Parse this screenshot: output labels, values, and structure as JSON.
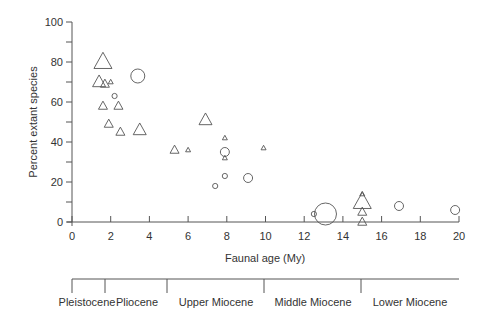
{
  "chart_data": {
    "type": "scatter",
    "title": "",
    "xlabel": "Faunal age (My)",
    "ylabel": "Percent extant species",
    "xlim": [
      0,
      20
    ],
    "ylim": [
      0,
      100
    ],
    "x_ticks": [
      0,
      2,
      4,
      6,
      8,
      10,
      12,
      14,
      16,
      18,
      20
    ],
    "y_ticks": [
      0,
      20,
      40,
      60,
      80,
      100
    ],
    "y_minor_ticks": [
      10,
      30,
      50,
      70,
      90
    ],
    "grid": false,
    "legend": null,
    "series": [
      {
        "name": "triangles",
        "marker": "triangle",
        "points": [
          {
            "x": 1.6,
            "y": 80,
            "size": "large"
          },
          {
            "x": 1.4,
            "y": 70,
            "size": "medium"
          },
          {
            "x": 1.7,
            "y": 69,
            "size": "small"
          },
          {
            "x": 2.0,
            "y": 70,
            "size": "tiny"
          },
          {
            "x": 1.6,
            "y": 58,
            "size": "small"
          },
          {
            "x": 2.4,
            "y": 58,
            "size": "small"
          },
          {
            "x": 1.9,
            "y": 49,
            "size": "small"
          },
          {
            "x": 2.5,
            "y": 45,
            "size": "small"
          },
          {
            "x": 3.5,
            "y": 46,
            "size": "medium"
          },
          {
            "x": 5.3,
            "y": 36,
            "size": "small"
          },
          {
            "x": 6.0,
            "y": 36,
            "size": "tiny"
          },
          {
            "x": 6.9,
            "y": 51,
            "size": "medium"
          },
          {
            "x": 7.9,
            "y": 42,
            "size": "tiny"
          },
          {
            "x": 7.9,
            "y": 32,
            "size": "tiny"
          },
          {
            "x": 9.9,
            "y": 37,
            "size": "tiny"
          },
          {
            "x": 15.0,
            "y": 14,
            "size": "tiny"
          },
          {
            "x": 15.0,
            "y": 10,
            "size": "large"
          },
          {
            "x": 15.0,
            "y": 5,
            "size": "small"
          },
          {
            "x": 15.0,
            "y": 0,
            "size": "small"
          }
        ]
      },
      {
        "name": "circles",
        "marker": "circle",
        "points": [
          {
            "x": 3.4,
            "y": 73,
            "size": "medium"
          },
          {
            "x": 2.2,
            "y": 63,
            "size": "tiny"
          },
          {
            "x": 7.9,
            "y": 35,
            "size": "small"
          },
          {
            "x": 7.9,
            "y": 23,
            "size": "tiny"
          },
          {
            "x": 7.4,
            "y": 18,
            "size": "tiny"
          },
          {
            "x": 9.1,
            "y": 22,
            "size": "small"
          },
          {
            "x": 12.5,
            "y": 4,
            "size": "tiny"
          },
          {
            "x": 13.1,
            "y": 4,
            "size": "xlarge"
          },
          {
            "x": 16.9,
            "y": 8,
            "size": "small"
          },
          {
            "x": 19.8,
            "y": 6,
            "size": "small"
          }
        ]
      }
    ],
    "timescale": {
      "boundaries_my": [
        0,
        1.7,
        4.9,
        10,
        15,
        20
      ],
      "epochs": [
        "Pleistocene",
        "Pliocene",
        "Upper Miocene",
        "Middle Miocene",
        "Lower Miocene"
      ]
    }
  },
  "labels": {
    "xlabel": "Faunal age (My)",
    "ylabel": "Percent extant species",
    "x_ticks": [
      "0",
      "2",
      "4",
      "6",
      "8",
      "10",
      "12",
      "14",
      "16",
      "18",
      "20"
    ],
    "y_ticks": [
      "0",
      "20",
      "40",
      "60",
      "80",
      "100"
    ],
    "epochs": [
      "Pleistocene",
      "Pliocene",
      "Upper Miocene",
      "Middle Miocene",
      "Lower Miocene"
    ]
  }
}
